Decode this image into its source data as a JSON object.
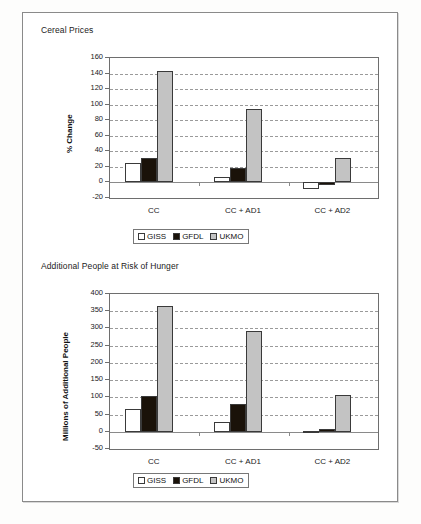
{
  "document": {
    "background_color": "#fdfdfc",
    "border_color": "#8a8a8a"
  },
  "legend_entries": [
    {
      "label": "GISS",
      "color": "#ffffff",
      "key": "giss"
    },
    {
      "label": "GFDL",
      "color": "#1a1209",
      "key": "gfdl"
    },
    {
      "label": "UKMO",
      "color": "#c3c3c3",
      "key": "ukmo"
    }
  ],
  "panels": [
    {
      "title": "Cereal Prices",
      "chart_id": "cereal-prices"
    },
    {
      "title": "Additional People at Risk of Hunger",
      "chart_id": "people-at-risk"
    }
  ],
  "chart_data": [
    {
      "type": "bar",
      "id": "cereal-prices",
      "title": "Cereal Prices",
      "xlabel": "",
      "ylabel": "% Change",
      "categories": [
        "CC",
        "CC + AD1",
        "CC + AD2"
      ],
      "series": [
        {
          "name": "GISS",
          "color": "#ffffff",
          "values": [
            25,
            7,
            -8
          ]
        },
        {
          "name": "GFDL",
          "color": "#1a1209",
          "values": [
            31,
            19,
            -3
          ]
        },
        {
          "name": "UKMO",
          "color": "#c3c3c3",
          "values": [
            143,
            95,
            32
          ]
        }
      ],
      "ylim": [
        -20,
        160
      ],
      "ytick_step": 20,
      "yticks": [
        -20,
        0,
        20,
        40,
        60,
        80,
        100,
        120,
        140,
        160
      ],
      "grid": true,
      "legend_position": "bottom"
    },
    {
      "type": "bar",
      "id": "people-at-risk",
      "title": "Additional People at Risk of Hunger",
      "xlabel": "",
      "ylabel": "Millions of Additional People",
      "categories": [
        "CC",
        "CC + AD1",
        "CC + AD2"
      ],
      "series": [
        {
          "name": "GISS",
          "color": "#ffffff",
          "values": [
            65,
            28,
            3
          ]
        },
        {
          "name": "GFDL",
          "color": "#1a1209",
          "values": [
            105,
            80,
            8
          ]
        },
        {
          "name": "UKMO",
          "color": "#c3c3c3",
          "values": [
            365,
            292,
            108
          ]
        }
      ],
      "ylim": [
        -50,
        400
      ],
      "ytick_step": 50,
      "yticks": [
        -50,
        0,
        50,
        100,
        150,
        200,
        250,
        300,
        350,
        400
      ],
      "grid": true,
      "legend_position": "bottom"
    }
  ]
}
